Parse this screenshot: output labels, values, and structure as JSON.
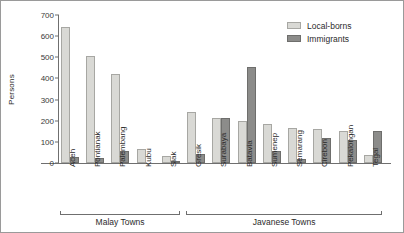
{
  "chart_data": {
    "type": "bar",
    "title": "",
    "xlabel": "",
    "ylabel": "Persons",
    "ylim": [
      0,
      700
    ],
    "ytick_step": 100,
    "yticks": [
      "0",
      "100",
      "200",
      "300",
      "400",
      "500",
      "600",
      "700"
    ],
    "grid": false,
    "legend_position": "top-right",
    "categories": [
      "Aceh",
      "Pontianak",
      "Palembang",
      "Kubu",
      "Siak",
      "Gresik",
      "Surabaya",
      "Batavia",
      "Sumenep",
      "Semarang",
      "Cirebon",
      "Pekalongan",
      "Tegal"
    ],
    "series": [
      {
        "name": "Local-borns",
        "color": "#d9d9d5",
        "values": [
          645,
          505,
          420,
          65,
          35,
          240,
          215,
          200,
          185,
          165,
          160,
          150,
          40
        ]
      },
      {
        "name": "Immigrants",
        "color": "#8c8c8a",
        "values": [
          30,
          25,
          55,
          0,
          10,
          45,
          215,
          455,
          55,
          20,
          120,
          110,
          150
        ]
      }
    ],
    "groups": [
      {
        "label": "Malay Towns",
        "categories": [
          "Aceh",
          "Pontianak",
          "Palembang",
          "Kubu",
          "Siak"
        ]
      },
      {
        "label": "Javanese Towns",
        "categories": [
          "Gresik",
          "Surabaya",
          "Batavia",
          "Sumenep",
          "Semarang",
          "Cirebon",
          "Pekalongan",
          "Tegal"
        ]
      }
    ]
  },
  "legend": {
    "items": [
      {
        "label": "Local-borns",
        "swatch": "local"
      },
      {
        "label": "Immigrants",
        "swatch": "imm"
      }
    ]
  }
}
